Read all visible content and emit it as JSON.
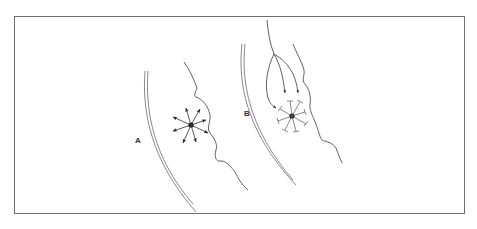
{
  "figure": {
    "panels": [
      {
        "id": "A",
        "label": "A",
        "description": "Central point with eight outward-pointing arrows (radial spread) between a double-lined curved wall and an irregular wavy boundary",
        "arrow_direction": "outward",
        "arrow_count": 8
      },
      {
        "id": "B",
        "label": "B",
        "description": "Central point with eight spokes ending in T-shaped bars (blocked spread), fed by three converging curved lines from above, between a double-lined curved wall and an irregular wavy boundary",
        "arrow_direction": "blocked",
        "spoke_count": 8,
        "incoming_lines": 3
      }
    ],
    "colors": {
      "stroke": "#3a3a3a",
      "frame": "#6e6e6e",
      "background": "#ffffff"
    }
  }
}
